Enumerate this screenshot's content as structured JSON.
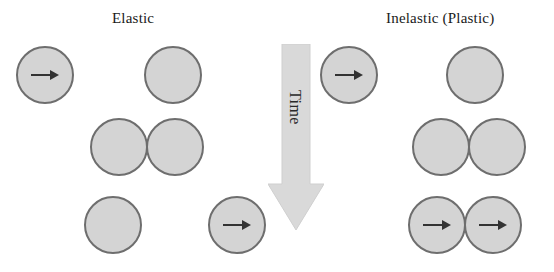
{
  "figure": {
    "title_elastic": "Elastic",
    "title_inelastic": "Inelastic (Plastic)",
    "time_label": "Time",
    "colors": {
      "ball_fill": "#d4d4d4",
      "ball_stroke": "#6e6e6e",
      "arrow_fill": "#d9d9d9",
      "arrow_stroke": "#cfcfcf",
      "text": "#1a1a1a",
      "background": "#ffffff"
    }
  },
  "chart_data": {
    "type": "diagram",
    "axis": {
      "direction": "vertical",
      "label": "Time",
      "arrow": "downward"
    },
    "columns": [
      {
        "name": "Elastic",
        "label": "Elastic"
      },
      {
        "name": "Inelastic",
        "label": "Inelastic (Plastic)"
      }
    ],
    "stages": [
      "before",
      "contact",
      "after"
    ],
    "elements": [
      {
        "id": "elastic-before-left",
        "column": "Elastic",
        "stage": "before",
        "x": 16,
        "y": 46,
        "d": 58,
        "moving": true,
        "arrow": "right"
      },
      {
        "id": "elastic-before-right",
        "column": "Elastic",
        "stage": "before",
        "x": 144,
        "y": 46,
        "d": 58,
        "moving": false,
        "arrow": "none"
      },
      {
        "id": "elastic-contact-left",
        "column": "Elastic",
        "stage": "contact",
        "x": 90,
        "y": 118,
        "d": 58,
        "moving": false,
        "arrow": "none"
      },
      {
        "id": "elastic-contact-right",
        "column": "Elastic",
        "stage": "contact",
        "x": 146,
        "y": 118,
        "d": 58,
        "moving": false,
        "arrow": "none"
      },
      {
        "id": "elastic-after-left",
        "column": "Elastic",
        "stage": "after",
        "x": 84,
        "y": 196,
        "d": 58,
        "moving": false,
        "arrow": "none"
      },
      {
        "id": "elastic-after-right",
        "column": "Elastic",
        "stage": "after",
        "x": 208,
        "y": 196,
        "d": 58,
        "moving": true,
        "arrow": "right"
      },
      {
        "id": "inelastic-before-left",
        "column": "Inelastic",
        "stage": "before",
        "x": 320,
        "y": 46,
        "d": 58,
        "moving": true,
        "arrow": "right"
      },
      {
        "id": "inelastic-before-right",
        "column": "Inelastic",
        "stage": "before",
        "x": 446,
        "y": 46,
        "d": 58,
        "moving": false,
        "arrow": "none"
      },
      {
        "id": "inelastic-contact-left",
        "column": "Inelastic",
        "stage": "contact",
        "x": 412,
        "y": 118,
        "d": 58,
        "moving": false,
        "arrow": "none"
      },
      {
        "id": "inelastic-contact-right",
        "column": "Inelastic",
        "stage": "contact",
        "x": 468,
        "y": 118,
        "d": 58,
        "moving": false,
        "arrow": "none"
      },
      {
        "id": "inelastic-after-left",
        "column": "Inelastic",
        "stage": "after",
        "x": 408,
        "y": 196,
        "d": 58,
        "moving": true,
        "arrow": "right"
      },
      {
        "id": "inelastic-after-right",
        "column": "Inelastic",
        "stage": "after",
        "x": 464,
        "y": 196,
        "d": 58,
        "moving": true,
        "arrow": "right"
      }
    ]
  }
}
